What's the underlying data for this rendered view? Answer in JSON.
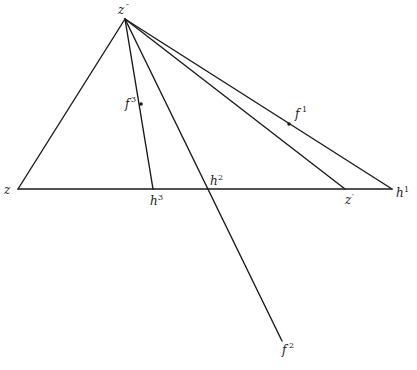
{
  "diagram": {
    "type": "geometric-construction",
    "points": {
      "z_double_prime": {
        "label": "z",
        "sup": "″",
        "x": 125,
        "y": 19
      },
      "z": {
        "label": "z",
        "sup": "",
        "x": 18,
        "y": 189
      },
      "h3": {
        "label": "h",
        "sup": "3",
        "x": 153,
        "y": 189
      },
      "h2": {
        "label": "h",
        "sup": "2",
        "x": 208,
        "y": 189
      },
      "z_prime": {
        "label": "z",
        "sup": "′",
        "x": 345,
        "y": 189
      },
      "h1": {
        "label": "h",
        "sup": "1",
        "x": 392,
        "y": 189
      },
      "f3": {
        "label": "f",
        "sup": "3",
        "x": 141,
        "y": 104
      },
      "f1": {
        "label": "f",
        "sup": "1",
        "x": 289,
        "y": 124
      },
      "f2": {
        "label": "f",
        "sup": "2",
        "x": 282,
        "y": 341
      }
    },
    "segments": [
      {
        "from": "z",
        "to": "h1"
      },
      {
        "from": "z_double_prime",
        "to": "z"
      },
      {
        "from": "z_double_prime",
        "to": "h3"
      },
      {
        "from": "z_double_prime",
        "to": "f2"
      },
      {
        "from": "z_double_prime",
        "to": "z_prime"
      },
      {
        "from": "z_double_prime",
        "to": "h1"
      }
    ],
    "marked_points": [
      "f3",
      "f1"
    ]
  },
  "labels": {
    "z_double_prime": {
      "base": "z",
      "sup": "″"
    },
    "z": {
      "base": "z",
      "sup": ""
    },
    "h3": {
      "base": "h",
      "sup": "3"
    },
    "h2": {
      "base": "h",
      "sup": "2"
    },
    "z_prime": {
      "base": "z",
      "sup": "′"
    },
    "h1": {
      "base": "h",
      "sup": "1"
    },
    "f3": {
      "base": "f",
      "sup": "3"
    },
    "f1": {
      "base": "f",
      "sup": "1"
    },
    "f2": {
      "base": "f",
      "sup": "2"
    }
  }
}
